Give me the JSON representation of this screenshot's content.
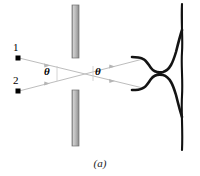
{
  "figure": {
    "caption": "(a)",
    "type": "two-source-interference-diagram",
    "sources": [
      {
        "label": "1",
        "x": 17,
        "y": 55,
        "dot_x": 18,
        "dot_y": 58
      },
      {
        "label": "2",
        "x": 17,
        "y": 87,
        "dot_x": 18,
        "dot_y": 91
      }
    ],
    "angles": [
      {
        "label": "θ",
        "x": 45,
        "y": 65
      },
      {
        "label": "θ",
        "x": 96,
        "y": 65
      }
    ],
    "barrier": {
      "color": "#a8a8a8",
      "edge_color": "#6e6e6e",
      "x": 72,
      "width": 7,
      "segments": [
        {
          "y": 5,
          "height": 53
        },
        {
          "y": 90,
          "height": 56
        }
      ]
    },
    "rays": {
      "color": "#b9b9b9",
      "cross_x": 75,
      "cross_y": 73,
      "paths": [
        {
          "from": "source-1",
          "x1": 19,
          "y1": 58,
          "x2": 143,
          "y2": 88
        },
        {
          "from": "source-2",
          "x1": 19,
          "y1": 91,
          "x2": 143,
          "y2": 59
        }
      ],
      "arrow_positions": [
        0.3,
        0.72
      ]
    },
    "intensity_curve": {
      "color": "#111111",
      "baseline_x": 182,
      "baseline_top": 4,
      "baseline_bottom": 150,
      "peaks": [
        {
          "center_y": 59,
          "tip_x": 143
        },
        {
          "center_y": 88,
          "tip_x": 143
        }
      ]
    }
  }
}
